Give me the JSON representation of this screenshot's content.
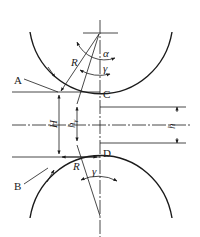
{
  "diagram": {
    "type": "rolling-mill-roll-gap-geometry",
    "colors": {
      "stroke": "#1a1a1a",
      "background": "#ffffff"
    },
    "points": {
      "A": "A",
      "B": "B",
      "C": "C",
      "D": "D"
    },
    "symbols": {
      "radius_top": "R",
      "radius_bottom": "R",
      "alpha": "α",
      "gamma_top": "γ",
      "gamma_bottom": "γ",
      "H": "H",
      "h1_main": "h",
      "h1_sub": "γ",
      "h": "h"
    }
  }
}
